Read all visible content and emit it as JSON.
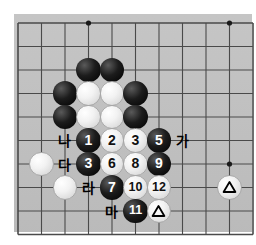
{
  "diagram": {
    "kind": "go-board-diagram",
    "board_color": "#c2c2c2",
    "page_color": "#ffffff",
    "line_color": "#4a4a4a",
    "black_color": "#000000",
    "white_color": "#f2f2f2",
    "grid": {
      "spacing": 23.5,
      "origin_x": 18,
      "origin_y": 23,
      "cols": 10,
      "rows": 9,
      "star_points": [
        {
          "col": 3,
          "row": 0
        },
        {
          "col": 9,
          "row": 0
        },
        {
          "col": 9,
          "row": 6
        }
      ]
    },
    "stones": [
      {
        "col": 3,
        "row": 2,
        "color": "black",
        "marker": "",
        "label": ""
      },
      {
        "col": 4,
        "row": 2,
        "color": "black",
        "marker": "",
        "label": ""
      },
      {
        "col": 2,
        "row": 3,
        "color": "black",
        "marker": "",
        "label": ""
      },
      {
        "col": 3,
        "row": 3,
        "color": "white",
        "marker": "",
        "label": ""
      },
      {
        "col": 4,
        "row": 3,
        "color": "white",
        "marker": "",
        "label": ""
      },
      {
        "col": 5,
        "row": 3,
        "color": "black",
        "marker": "",
        "label": ""
      },
      {
        "col": 2,
        "row": 4,
        "color": "black",
        "marker": "",
        "label": ""
      },
      {
        "col": 3,
        "row": 4,
        "color": "white",
        "marker": "",
        "label": ""
      },
      {
        "col": 4,
        "row": 4,
        "color": "white",
        "marker": "",
        "label": ""
      },
      {
        "col": 5,
        "row": 4,
        "color": "black",
        "marker": "",
        "label": ""
      },
      {
        "col": 3,
        "row": 5,
        "color": "black",
        "marker": "",
        "label": "1"
      },
      {
        "col": 4,
        "row": 5,
        "color": "white",
        "marker": "",
        "label": "2"
      },
      {
        "col": 5,
        "row": 5,
        "color": "white",
        "marker": "",
        "label": "3"
      },
      {
        "col": 6,
        "row": 5,
        "color": "black",
        "marker": "",
        "label": "5"
      },
      {
        "col": 1,
        "row": 6,
        "color": "white",
        "marker": "",
        "label": ""
      },
      {
        "col": 3,
        "row": 6,
        "color": "black",
        "marker": "",
        "label": "3"
      },
      {
        "col": 4,
        "row": 6,
        "color": "white",
        "marker": "",
        "label": "6"
      },
      {
        "col": 5,
        "row": 6,
        "color": "white",
        "marker": "",
        "label": "8"
      },
      {
        "col": 6,
        "row": 6,
        "color": "black",
        "marker": "",
        "label": "9"
      },
      {
        "col": 2,
        "row": 7,
        "color": "white",
        "marker": "",
        "label": ""
      },
      {
        "col": 4,
        "row": 7,
        "color": "black",
        "marker": "",
        "label": "7"
      },
      {
        "col": 5,
        "row": 7,
        "color": "white",
        "marker": "",
        "label": "10"
      },
      {
        "col": 6,
        "row": 7,
        "color": "white",
        "marker": "",
        "label": "12"
      },
      {
        "col": 9,
        "row": 7,
        "color": "white",
        "marker": "triangle",
        "label": ""
      },
      {
        "col": 5,
        "row": 8,
        "color": "black",
        "marker": "",
        "label": "11"
      },
      {
        "col": 6,
        "row": 8,
        "color": "white",
        "marker": "triangle",
        "label": ""
      }
    ],
    "point_labels": [
      {
        "col": 2,
        "row": 5,
        "text": "나"
      },
      {
        "col": 7,
        "row": 5,
        "text": "가"
      },
      {
        "col": 2,
        "row": 6,
        "text": "다"
      },
      {
        "col": 3,
        "row": 7,
        "text": "라"
      },
      {
        "col": 4,
        "row": 8,
        "text": "마"
      }
    ],
    "move_numbers": [
      "1",
      "2",
      "3",
      "5",
      "3",
      "6",
      "8",
      "9",
      "7",
      "10",
      "12",
      "11"
    ],
    "korean_labels": [
      "가",
      "나",
      "다",
      "라",
      "마"
    ]
  }
}
